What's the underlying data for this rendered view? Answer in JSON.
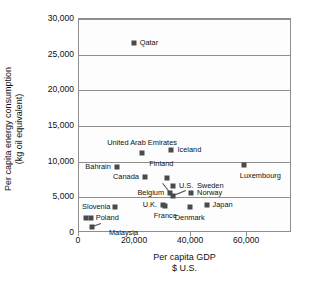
{
  "chart_data": {
    "type": "scatter",
    "title": "",
    "xlabel": "Per capita GDP",
    "xlabel_line2": "$ U.S.",
    "ylabel": "Per capita energy consumption",
    "ylabel_line2": "(kg oil equivalent)",
    "xlim": [
      0,
      76000
    ],
    "ylim": [
      0,
      30000
    ],
    "xticks": [
      0,
      20000,
      40000,
      60000
    ],
    "xtick_labels": [
      "0",
      "20,000",
      "40,000",
      "60,000"
    ],
    "yticks": [
      0,
      5000,
      10000,
      15000,
      20000,
      25000,
      30000
    ],
    "ytick_labels": [
      "0",
      "5,000",
      "10,000",
      "15,000",
      "20,000",
      "25,000",
      "30,000"
    ],
    "grid": "horizontal",
    "legend": "none",
    "marker_color": "#4a4a4a",
    "axis_color": "#8e8e8e",
    "points": [
      {
        "name": "Qatar",
        "x": 19500,
        "y": 26700,
        "label": "Qatar",
        "pos": "l",
        "dx": 6,
        "dy": 0
      },
      {
        "name": "United Arab Emirates",
        "x": 22500,
        "y": 11200,
        "label": "United Arab Emirates",
        "pos": "c",
        "dx": 0,
        "dy": -10
      },
      {
        "name": "Iceland",
        "x": 33000,
        "y": 11600,
        "label": "Iceland",
        "pos": "l",
        "dx": 6,
        "dy": 0
      },
      {
        "name": "Bahrain",
        "x": 13500,
        "y": 9300,
        "label": "Bahrain",
        "pos": "r",
        "dx": -6,
        "dy": 0
      },
      {
        "name": "Luxembourg",
        "x": 59000,
        "y": 9500,
        "label": "Luxembourg",
        "pos": "c",
        "dx": 16,
        "dy": 11
      },
      {
        "name": "Canada",
        "x": 23500,
        "y": 7900,
        "label": "Canada",
        "pos": "r",
        "dx": -6,
        "dy": 0
      },
      {
        "name": "Finland",
        "x": 31500,
        "y": 7700,
        "label": "Finland",
        "pos": "c",
        "dx": -6,
        "dy": -14
      },
      {
        "name": "U.S.",
        "x": 33500,
        "y": 6600,
        "label": "U.S.",
        "pos": "l",
        "dx": 6,
        "dy": 0
      },
      {
        "name": "Belgium",
        "x": 32500,
        "y": 5600,
        "label": "Belgium",
        "pos": "r",
        "dx": -6,
        "dy": 0
      },
      {
        "name": "Sweden",
        "x": 33500,
        "y": 5150,
        "label": "Sweden",
        "pos": "l",
        "dx": 24,
        "dy": -10
      },
      {
        "name": "Norway",
        "x": 40000,
        "y": 5600,
        "label": "Norway",
        "pos": "l",
        "dx": 6,
        "dy": 0
      },
      {
        "name": "Slovenia",
        "x": 13000,
        "y": 3600,
        "label": "Slovenia",
        "pos": "r",
        "dx": -5,
        "dy": 0
      },
      {
        "name": "U.K.",
        "x": 30000,
        "y": 3900,
        "label": "U.K.",
        "pos": "r",
        "dx": -6,
        "dy": 0
      },
      {
        "name": "France",
        "x": 30800,
        "y": 3800,
        "label": "France",
        "pos": "c",
        "dx": 0,
        "dy": 10
      },
      {
        "name": "Denmark",
        "x": 39500,
        "y": 3600,
        "label": "Denmark",
        "pos": "c",
        "dx": 0,
        "dy": 11
      },
      {
        "name": "Japan",
        "x": 45500,
        "y": 3900,
        "label": "Japan",
        "pos": "l",
        "dx": 6,
        "dy": 0
      },
      {
        "name": "Poland",
        "x": 4200,
        "y": 2050,
        "label": "Poland",
        "pos": "l",
        "dx": 5,
        "dy": 0
      },
      {
        "name": "Poland-b",
        "x": 2400,
        "y": 2050,
        "label": "",
        "pos": "l",
        "dx": 0,
        "dy": 0
      },
      {
        "name": "Malaysia",
        "x": 4600,
        "y": 800,
        "label": "Malaysia",
        "pos": "l",
        "dx": 17,
        "dy": 6
      }
    ],
    "leaders": [
      {
        "name": "finland-leader",
        "x1": 30000,
        "y1": 7050,
        "x2": 32600,
        "y2": 5750
      },
      {
        "name": "sweden-leader",
        "x1": 38000,
        "y1": 5900,
        "x2": 33900,
        "y2": 5250
      },
      {
        "name": "malaysia-leader",
        "x1": 7800,
        "y1": 1250,
        "x2": 5000,
        "y2": 850
      }
    ]
  }
}
